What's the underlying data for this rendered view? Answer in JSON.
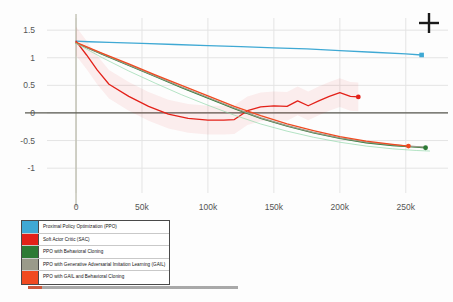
{
  "chart_data": {
    "type": "line",
    "title": "",
    "xlabel": "",
    "ylabel": "",
    "xlim": [
      -22000,
      282000
    ],
    "ylim": [
      -1.45,
      1.72
    ],
    "grid": true,
    "legend_position": "below-left",
    "xticks": [
      "0",
      "50k",
      "100k",
      "150k",
      "200k",
      "250k"
    ],
    "xtick_values": [
      0,
      50000,
      100000,
      150000,
      200000,
      250000
    ],
    "yticks": [
      "1.5",
      "1",
      "0.5",
      "0",
      "-0.5",
      "-1"
    ],
    "ytick_values": [
      1.5,
      1,
      0.5,
      0,
      -0.5,
      -1
    ],
    "zero_line": 0,
    "series": [
      {
        "name": "Proximal Policy Optimization (PPO)",
        "color": "#3fa9d4",
        "endpoint_marker": "square",
        "x": [
          0,
          10000,
          25000,
          50000,
          75000,
          100000,
          125000,
          150000,
          175000,
          200000,
          225000,
          250000,
          262000
        ],
        "values": [
          1.3,
          1.29,
          1.28,
          1.26,
          1.24,
          1.22,
          1.2,
          1.18,
          1.16,
          1.13,
          1.1,
          1.07,
          1.05
        ]
      },
      {
        "name": "Soft Actor Critic (SAC)",
        "color": "#e32119",
        "endpoint_marker": "circle",
        "x": [
          0,
          8000,
          16000,
          25000,
          40000,
          55000,
          70000,
          85000,
          100000,
          112000,
          120000,
          130000,
          140000,
          150000,
          160000,
          168000,
          176000,
          184000,
          192000,
          200000,
          208000,
          214000
        ],
        "values": [
          1.3,
          1.05,
          0.78,
          0.52,
          0.3,
          0.12,
          -0.02,
          -0.1,
          -0.13,
          -0.13,
          -0.12,
          0.04,
          0.11,
          0.13,
          0.12,
          0.22,
          0.13,
          0.22,
          0.3,
          0.37,
          0.3,
          0.29
        ]
      },
      {
        "name": "PPO with Behavioral Cloning",
        "color": "#2d7a35",
        "endpoint_marker": "circle",
        "x": [
          0,
          20000,
          40000,
          60000,
          80000,
          100000,
          120000,
          140000,
          160000,
          180000,
          200000,
          220000,
          240000,
          258000,
          265000
        ],
        "values": [
          1.27,
          1.06,
          0.86,
          0.66,
          0.46,
          0.27,
          0.08,
          -0.1,
          -0.24,
          -0.36,
          -0.46,
          -0.54,
          -0.59,
          -0.62,
          -0.63
        ]
      },
      {
        "name": "PPO with Generative Adversarial Imitation Learning (GAIL)",
        "color": "#9a9a8a",
        "endpoint_marker": "none",
        "x": [
          0,
          20000,
          40000,
          60000,
          80000,
          100000,
          120000,
          140000,
          160000,
          180000,
          200000,
          220000,
          240000,
          258000,
          265000
        ],
        "values": [
          1.27,
          1.07,
          0.87,
          0.67,
          0.47,
          0.28,
          0.09,
          -0.09,
          -0.23,
          -0.35,
          -0.45,
          -0.53,
          -0.58,
          -0.61,
          -0.62
        ]
      },
      {
        "name": "PPO with GAIL and Behavioral Cloning",
        "color": "#f04a20",
        "endpoint_marker": "circle",
        "x": [
          0,
          20000,
          40000,
          60000,
          80000,
          100000,
          120000,
          140000,
          160000,
          180000,
          200000,
          220000,
          240000,
          252000
        ],
        "values": [
          1.28,
          1.08,
          0.89,
          0.69,
          0.5,
          0.31,
          0.12,
          -0.05,
          -0.2,
          -0.32,
          -0.43,
          -0.51,
          -0.57,
          -0.6
        ]
      },
      {
        "name": "PPO with Behavioral Cloning (variance band)",
        "color": "#8fd6a8",
        "endpoint_marker": "none",
        "x": [
          0,
          20000,
          40000,
          60000,
          80000,
          100000,
          120000,
          140000,
          160000,
          180000,
          200000,
          220000,
          240000,
          258000,
          268000
        ],
        "values": [
          1.26,
          1.0,
          0.76,
          0.54,
          0.33,
          0.14,
          -0.04,
          -0.2,
          -0.33,
          -0.44,
          -0.53,
          -0.6,
          -0.65,
          -0.68,
          -0.69
        ]
      }
    ]
  },
  "legend": {
    "items": [
      {
        "label": "Proximal Policy Optimization (PPO)",
        "color": "#3fa9d4"
      },
      {
        "label": "Soft Actor Critic (SAC)",
        "color": "#e32119"
      },
      {
        "label": "PPO with Behavioral Cloning",
        "color": "#2d7a35"
      },
      {
        "label": "PPO with Generative Adversarial Imitation Learning (GAIL)",
        "color": "#9a9a8a"
      },
      {
        "label": "PPO with GAIL and Behavioral Cloning",
        "color": "#f04a20"
      }
    ]
  },
  "cursor": {
    "icon": "crosshair-icon"
  }
}
